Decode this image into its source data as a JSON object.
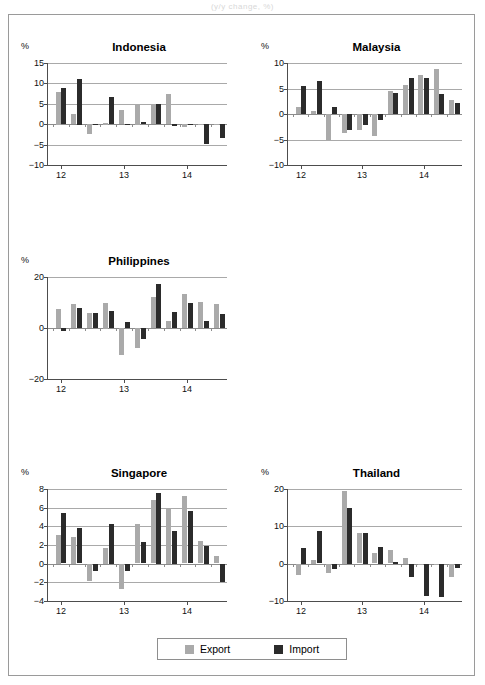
{
  "caption": "(y/y change, %)",
  "legend": {
    "export_label": "Export",
    "import_label": "Import",
    "export_color": "#aaaaaa",
    "import_color": "#2b2b2b"
  },
  "axis_unit": "%",
  "chart_data": [
    {
      "type": "bar",
      "title": "Indonesia",
      "xlabel": "",
      "ylabel": "%",
      "ylim": [
        -10,
        15
      ],
      "yticks": [
        15,
        10,
        5,
        0,
        -5,
        -10
      ],
      "grid": true,
      "legend_position": "bottom",
      "categories": [
        "12Q1",
        "12Q2",
        "12Q3",
        "12Q4",
        "13Q1",
        "13Q2",
        "13Q3",
        "13Q4",
        "14Q1",
        "14Q2",
        "14Q3"
      ],
      "xtick_labels": [
        "12",
        "13",
        "14"
      ],
      "xtick_at": [
        0,
        4,
        8
      ],
      "series": [
        {
          "name": "Export",
          "values": [
            8.0,
            2.5,
            -2.4,
            0.4,
            3.5,
            4.8,
            4.9,
            7.3,
            -0.7,
            0.0,
            0.0
          ]
        },
        {
          "name": "Import",
          "values": [
            8.8,
            11.2,
            -0.3,
            6.6,
            -0.2,
            0.6,
            5.0,
            -0.5,
            -0.2,
            -5.0,
            -3.4
          ]
        }
      ]
    },
    {
      "type": "bar",
      "title": "Malaysia",
      "xlabel": "",
      "ylabel": "%",
      "ylim": [
        -10,
        10
      ],
      "yticks": [
        10,
        5,
        0,
        -5,
        -10
      ],
      "grid": true,
      "legend_position": "bottom",
      "categories": [
        "12Q1",
        "12Q2",
        "12Q3",
        "12Q4",
        "13Q1",
        "13Q2",
        "13Q3",
        "13Q4",
        "14Q1",
        "14Q2",
        "14Q3"
      ],
      "xtick_labels": [
        "12",
        "13",
        "14"
      ],
      "xtick_at": [
        0,
        4,
        8
      ],
      "series": [
        {
          "name": "Export",
          "values": [
            1.3,
            0.5,
            -5.1,
            -3.8,
            -3.2,
            -4.4,
            4.5,
            5.7,
            7.7,
            8.8,
            2.7
          ]
        },
        {
          "name": "Import",
          "values": [
            5.5,
            6.5,
            1.3,
            -3.2,
            -2.1,
            -1.2,
            4.2,
            7.0,
            7.1,
            3.9,
            2.1
          ]
        }
      ]
    },
    {
      "type": "bar",
      "title": "Philippines",
      "xlabel": "",
      "ylabel": "%",
      "ylim": [
        -20,
        20
      ],
      "yticks": [
        20,
        0,
        -20
      ],
      "grid": true,
      "legend_position": "bottom",
      "categories": [
        "12Q1",
        "12Q2",
        "12Q3",
        "12Q4",
        "13Q1",
        "13Q2",
        "13Q3",
        "13Q4",
        "14Q1",
        "14Q2",
        "14Q3"
      ],
      "xtick_labels": [
        "12",
        "13",
        "14"
      ],
      "xtick_at": [
        0,
        4,
        8
      ],
      "series": [
        {
          "name": "Export",
          "values": [
            7.4,
            9.3,
            6.0,
            10.0,
            -10.5,
            -8.0,
            12.3,
            2.7,
            13.2,
            10.3,
            9.5
          ]
        },
        {
          "name": "Import",
          "values": [
            -1.3,
            7.8,
            5.9,
            6.6,
            2.3,
            -4.3,
            17.3,
            6.1,
            9.8,
            2.8,
            5.6
          ]
        }
      ]
    },
    {
      "type": "bar",
      "title": "Singapore",
      "xlabel": "",
      "ylabel": "%",
      "ylim": [
        -4,
        8
      ],
      "yticks": [
        8,
        6,
        4,
        2,
        0,
        -2,
        -4
      ],
      "grid": true,
      "legend_position": "bottom",
      "categories": [
        "12Q1",
        "12Q2",
        "12Q3",
        "12Q4",
        "13Q1",
        "13Q2",
        "13Q3",
        "13Q4",
        "14Q1",
        "14Q2",
        "14Q3"
      ],
      "xtick_labels": [
        "12",
        "13",
        "14"
      ],
      "xtick_at": [
        0,
        4,
        8
      ],
      "series": [
        {
          "name": "Export",
          "values": [
            3.1,
            2.9,
            -1.8,
            1.7,
            -2.7,
            4.2,
            6.8,
            6.0,
            7.2,
            2.4,
            0.8
          ]
        },
        {
          "name": "Import",
          "values": [
            5.4,
            3.8,
            -0.7,
            4.3,
            -0.8,
            2.3,
            7.6,
            3.5,
            5.6,
            1.9,
            -1.9
          ]
        }
      ]
    },
    {
      "type": "bar",
      "title": "Thailand",
      "xlabel": "",
      "ylabel": "%",
      "ylim": [
        -10,
        20
      ],
      "yticks": [
        20,
        10,
        0,
        -10
      ],
      "grid": true,
      "legend_position": "bottom",
      "categories": [
        "12Q1",
        "12Q2",
        "12Q3",
        "12Q4",
        "13Q1",
        "13Q2",
        "13Q3",
        "13Q4",
        "14Q1",
        "14Q2",
        "14Q3"
      ],
      "xtick_labels": [
        "12",
        "13",
        "14"
      ],
      "xtick_at": [
        0,
        4,
        8
      ],
      "series": [
        {
          "name": "Export",
          "values": [
            -3.0,
            1.1,
            -2.4,
            19.5,
            8.1,
            2.8,
            3.6,
            1.6,
            -0.2,
            -0.3,
            -3.5
          ]
        },
        {
          "name": "Import",
          "values": [
            4.2,
            8.7,
            -1.4,
            15.0,
            8.2,
            4.5,
            0.5,
            -3.4,
            -8.5,
            -8.8,
            -1.2
          ]
        }
      ]
    }
  ],
  "panels": [
    {
      "key": "indonesia",
      "left": 12,
      "top": 26,
      "width": 210,
      "height": 150
    },
    {
      "key": "malaysia",
      "left": 252,
      "top": 26,
      "width": 205,
      "height": 150
    },
    {
      "key": "philippines",
      "left": 12,
      "top": 240,
      "width": 210,
      "height": 150
    },
    {
      "key": "singapore",
      "left": 12,
      "top": 452,
      "width": 210,
      "height": 160
    },
    {
      "key": "thailand",
      "left": 252,
      "top": 452,
      "width": 205,
      "height": 160
    }
  ]
}
